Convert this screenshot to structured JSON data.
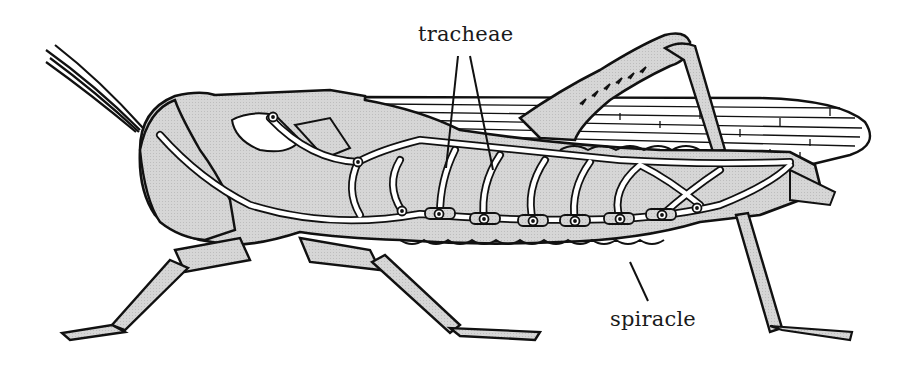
{
  "diagram": {
    "colors": {
      "outline": "#111111",
      "body_fill": "#d4d4d4",
      "trachea_fill": "#ffffff",
      "background": "#ffffff"
    },
    "labels": [
      {
        "id": "tracheae",
        "text": "tracheae",
        "x": 418,
        "y": 22
      },
      {
        "id": "spiracle",
        "text": "spiracle",
        "x": 610,
        "y": 307
      }
    ],
    "leader_lines": [
      {
        "label": "tracheae",
        "from": [
          458,
          56
        ],
        "to": [
          446,
          168
        ]
      },
      {
        "label": "tracheae",
        "from": [
          470,
          56
        ],
        "to": [
          493,
          170
        ]
      },
      {
        "label": "spiracle",
        "from": [
          630,
          262
        ],
        "to": [
          648,
          301
        ]
      }
    ],
    "spiracles": [
      {
        "x": 273,
        "y": 117
      },
      {
        "x": 358,
        "y": 162
      },
      {
        "x": 402,
        "y": 211
      },
      {
        "x": 439,
        "y": 214
      },
      {
        "x": 484,
        "y": 219
      },
      {
        "x": 533,
        "y": 221
      },
      {
        "x": 575,
        "y": 221
      },
      {
        "x": 620,
        "y": 219
      },
      {
        "x": 662,
        "y": 215
      },
      {
        "x": 697,
        "y": 208
      }
    ]
  }
}
